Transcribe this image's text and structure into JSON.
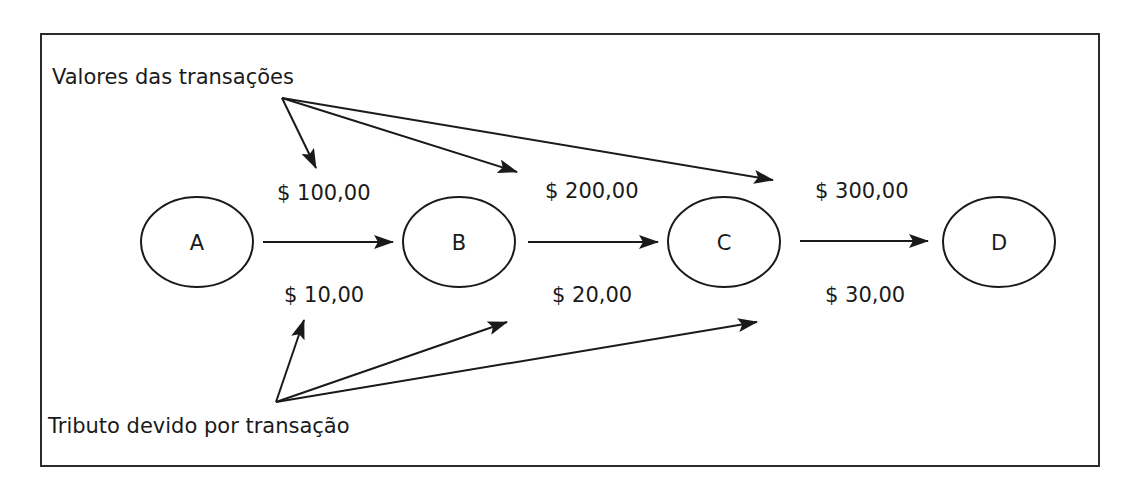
{
  "diagram": {
    "title_top": "Valores das transações",
    "title_bottom": "Tributo devido por transação",
    "nodes": [
      {
        "id": "A",
        "label": "A"
      },
      {
        "id": "B",
        "label": "B"
      },
      {
        "id": "C",
        "label": "C"
      },
      {
        "id": "D",
        "label": "D"
      }
    ],
    "edges": [
      {
        "from": "A",
        "to": "B",
        "transaction_value": "$ 100,00",
        "tax_due": "$ 10,00"
      },
      {
        "from": "B",
        "to": "C",
        "transaction_value": "$ 200,00",
        "tax_due": "$ 20,00"
      },
      {
        "from": "C",
        "to": "D",
        "transaction_value": "$ 300,00",
        "tax_due": "$ 30,00"
      }
    ],
    "colors": {
      "stroke": "#1a1a1a",
      "background": "#ffffff",
      "frame": "#2b2b2b"
    }
  }
}
